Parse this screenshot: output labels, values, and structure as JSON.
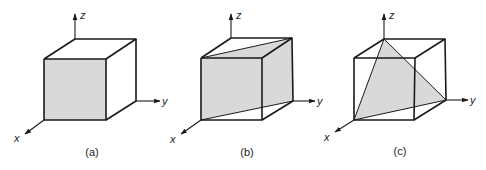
{
  "figure": {
    "shade_color": "#d9d9d9",
    "line_color": "#1a1a1a",
    "panels": [
      {
        "id": "a",
        "caption": "(a)",
        "plane": "front face (x = const)",
        "axes": {
          "x": "x",
          "y": "y",
          "z": "z"
        }
      },
      {
        "id": "b",
        "caption": "(b)",
        "plane": "diagonal plane through front-left and back-right vertical edges",
        "axes": {
          "x": "x",
          "y": "y",
          "z": "z"
        }
      },
      {
        "id": "c",
        "caption": "(c)",
        "plane": "triangular plane through three corner vertices",
        "axes": {
          "x": "x",
          "y": "y",
          "z": "z"
        }
      }
    ]
  }
}
